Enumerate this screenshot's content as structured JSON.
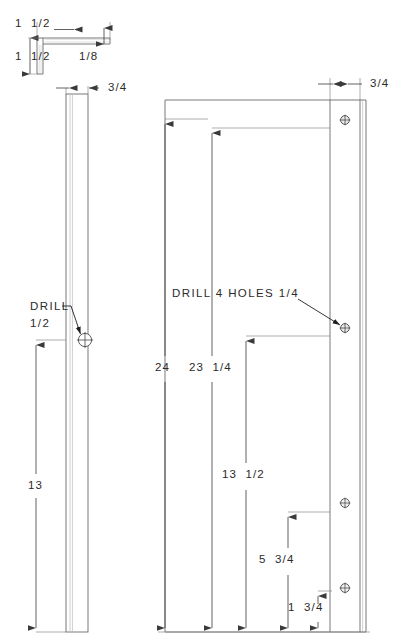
{
  "drawing": {
    "title": "Angle iron bracket fabrication drawing",
    "units": "inches",
    "line_color": "#555555",
    "thin_line_color": "#8f8f8f",
    "text_color": "#2b2b2b",
    "background": "#ffffff"
  },
  "cross_section": {
    "name": "L-angle profile detail",
    "dim_width_label": "1  1/2",
    "dim_height_label": "1  1/2",
    "dim_thickness_label": "1/8"
  },
  "side_view": {
    "name": "side elevation of angle",
    "dim_width_label": "3/4",
    "drill_note_line1": "DRILL",
    "drill_note_line2": "1/2",
    "dim_from_hole_to_bottom_label": "13"
  },
  "front_view": {
    "name": "front elevation of angle",
    "dim_flange_label": "3/4",
    "drill_note": "DRILL 4 HOLES 1/4",
    "dim_overall_label": "24",
    "dim_hole1_label": "23  1/4",
    "dim_hole2_label": "13  1/2",
    "dim_hole3_label": "5  3/4",
    "dim_hole4_label": "1  3/4"
  },
  "holes": {
    "side_hole_label": "1/2",
    "front_hole_label": "1/4",
    "front_hole_count": 4
  }
}
